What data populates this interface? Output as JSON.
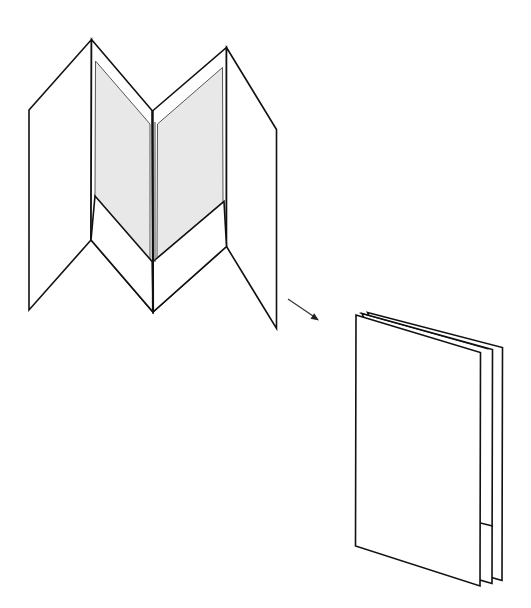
{
  "diagram": {
    "colors": {
      "line": "#111111",
      "inner_panel_fill": "#e8e8e8",
      "background": "#ffffff"
    },
    "elements": [
      {
        "id": "open-brochure",
        "label": "Open brochure with pockets"
      },
      {
        "id": "arrow",
        "label": "Fold direction arrow"
      },
      {
        "id": "closed-brochure",
        "label": "Folded brochure"
      }
    ]
  }
}
